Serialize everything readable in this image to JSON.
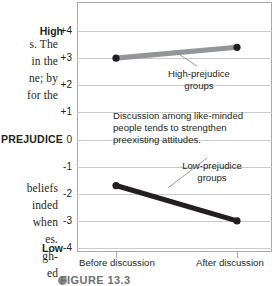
{
  "page_text": {
    "column_lines_upper": [
      "s. The",
      "in the",
      "ne; by",
      "for the"
    ],
    "column_lines_lower": [
      "beliefs",
      "inded",
      "when",
      "es.",
      "gh-",
      "ed"
    ]
  },
  "axis": {
    "name": "PREJUDICE",
    "high_label": "High",
    "low_label": "Low"
  },
  "annotations": {
    "high_group": "High-prejudice groups",
    "low_group": "Low-prejudice groups",
    "callout": "Discussion among like-minded people tends to strengthen preexisting attitudes."
  },
  "caption": {
    "bullet": "figure-bullet-icon",
    "text": "FIGURE 13.3"
  },
  "colors": {
    "high_series": "#939598",
    "low_series": "#231f20",
    "grid": "#c9cacc",
    "frame": "#a7a9ac",
    "leader": "#8a8c8e"
  },
  "chart_data": {
    "type": "line",
    "title": "",
    "xlabel": "",
    "ylabel": "PREJUDICE",
    "ylim": [
      -4,
      4
    ],
    "yticks": [
      "+4",
      "+3",
      "+2",
      "+1",
      "0",
      "-1",
      "-2",
      "-3",
      "-4"
    ],
    "ytick_values": [
      4,
      3,
      2,
      1,
      0,
      -1,
      -2,
      -3,
      -4
    ],
    "grid": true,
    "legend": "annotated-inline",
    "categories": [
      "Before discussion",
      "After discussion"
    ],
    "series": [
      {
        "name": "High-prejudice groups",
        "values": [
          3.0,
          3.4
        ],
        "color": "#939598"
      },
      {
        "name": "Low-prejudice groups",
        "values": [
          -1.7,
          -3.0
        ],
        "color": "#231f20"
      }
    ]
  }
}
